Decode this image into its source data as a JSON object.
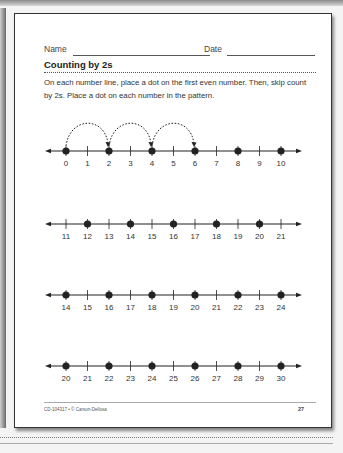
{
  "worksheet": {
    "name_label": "Name",
    "date_label": "Date",
    "title": "Counting by 2s",
    "instructions": "On each number line, place a dot on the first even number. Then, skip count by 2s. Place a dot on each number in the pattern.",
    "footer_text": "CD-104317 • © Carson-Dellosa",
    "page_number": "27"
  },
  "number_lines": [
    {
      "labels": [
        "0",
        "1",
        "2",
        "3",
        "4",
        "5",
        "6",
        "7",
        "8",
        "9",
        "10"
      ],
      "dots": [
        "0",
        "2",
        "4",
        "6",
        "8",
        "10"
      ],
      "example_jumps": [
        [
          "0",
          "2"
        ],
        [
          "2",
          "4"
        ],
        [
          "4",
          "6"
        ]
      ]
    },
    {
      "labels": [
        "11",
        "12",
        "13",
        "14",
        "15",
        "16",
        "17",
        "18",
        "19",
        "20",
        "21"
      ],
      "dots": [
        "12",
        "14",
        "16",
        "18",
        "20"
      ],
      "example_jumps": []
    },
    {
      "labels": [
        "14",
        "15",
        "16",
        "17",
        "18",
        "19",
        "20",
        "21",
        "22",
        "23",
        "24"
      ],
      "dots": [
        "14",
        "16",
        "18",
        "20",
        "22",
        "24"
      ],
      "example_jumps": []
    },
    {
      "labels": [
        "20",
        "21",
        "22",
        "23",
        "24",
        "25",
        "26",
        "27",
        "28",
        "29",
        "30"
      ],
      "dots": [
        "20",
        "22",
        "24",
        "26",
        "28",
        "30"
      ],
      "example_jumps": []
    }
  ],
  "colors": {
    "ink": "#222222",
    "page": "#ffffff",
    "frame": "#333333"
  }
}
